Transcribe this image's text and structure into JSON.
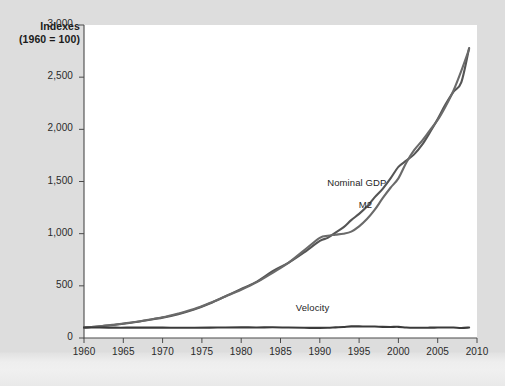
{
  "chart_data": {
    "type": "line",
    "title_line1": "Indexes",
    "title_line2": "(1960 = 100)",
    "xlabel": "",
    "ylabel": "Indexes (1960 = 100)",
    "xlim": [
      1960,
      2010
    ],
    "ylim": [
      0,
      3000
    ],
    "grid": false,
    "legend_position": "inline-annotations",
    "yticks": [
      0,
      500,
      1000,
      1500,
      2000,
      2500,
      3000
    ],
    "ytick_labels": [
      "0",
      "500",
      "1,000",
      "1,500",
      "2,000",
      "2,500",
      "3,000"
    ],
    "xticks": [
      1960,
      1965,
      1970,
      1975,
      1980,
      1985,
      1990,
      1995,
      2000,
      2005,
      2010
    ],
    "xtick_labels": [
      "1960",
      "1965",
      "1970",
      "1975",
      "1980",
      "1985",
      "1990",
      "1995",
      "2000",
      "2005",
      "2010"
    ],
    "x": [
      1960,
      1962,
      1964,
      1966,
      1968,
      1970,
      1972,
      1974,
      1976,
      1978,
      1980,
      1982,
      1984,
      1986,
      1988,
      1990,
      1991,
      1992,
      1993,
      1994,
      1995,
      1996,
      1997,
      1998,
      1999,
      2000,
      2001,
      2002,
      2003,
      2004,
      2005,
      2006,
      2007,
      2008,
      2009
    ],
    "series": [
      {
        "name": "Nominal GDP",
        "label": "Nominal GDP",
        "color": "#555555",
        "values": [
          100,
          112,
          127,
          146,
          170,
          195,
          228,
          272,
          330,
          400,
          470,
          540,
          640,
          720,
          820,
          930,
          960,
          1010,
          1060,
          1130,
          1190,
          1260,
          1350,
          1430,
          1530,
          1640,
          1700,
          1760,
          1850,
          1970,
          2100,
          2240,
          2360,
          2450,
          2780
        ]
      },
      {
        "name": "M2",
        "label": "M2",
        "color": "#6a6a6a",
        "values": [
          100,
          113,
          130,
          148,
          172,
          198,
          235,
          278,
          335,
          398,
          462,
          535,
          625,
          720,
          840,
          960,
          980,
          990,
          1000,
          1020,
          1070,
          1140,
          1230,
          1340,
          1440,
          1530,
          1680,
          1800,
          1890,
          1990,
          2090,
          2220,
          2370,
          2560,
          2770
        ]
      },
      {
        "name": "Velocity",
        "label": "Velocity",
        "color": "#3a3a3a",
        "values": [
          100,
          100,
          99,
          99,
          99,
          99,
          98,
          98,
          99,
          101,
          102,
          101,
          103,
          100,
          98,
          97,
          98,
          102,
          106,
          111,
          111,
          110,
          110,
          107,
          106,
          107,
          101,
          98,
          98,
          99,
          100,
          101,
          100,
          96,
          100
        ]
      }
    ],
    "annotations": [
      {
        "name": "Nominal GDP",
        "x": 1994,
        "y": 1490
      },
      {
        "name": "M2",
        "x": 1998,
        "y": 1270
      },
      {
        "name": "Velocity",
        "x": 1990,
        "y": 290
      }
    ],
    "axis_color": "#4a4a4a",
    "plot_background": "#ffffff",
    "figure_background": "#dcdcdc"
  }
}
